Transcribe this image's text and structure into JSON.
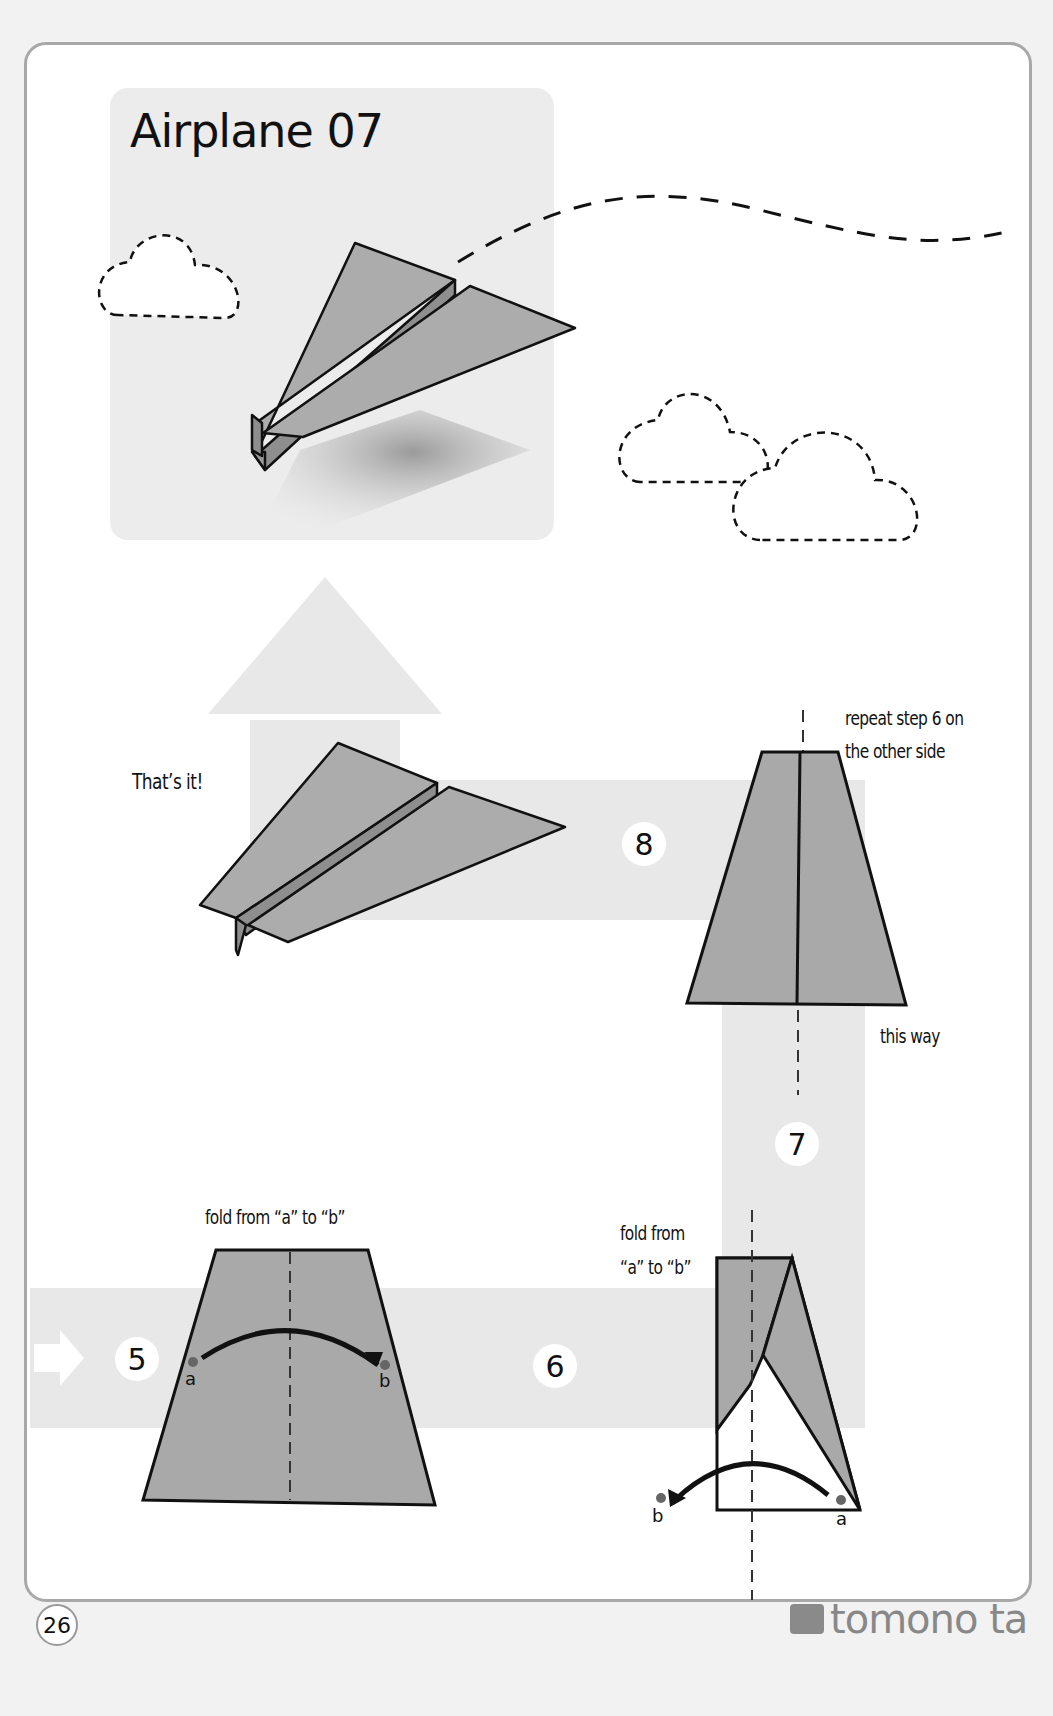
{
  "title": "Airplane 07",
  "steps": [
    {
      "number": "5",
      "instruction": "fold from “a” to “b”",
      "point_a": "a",
      "point_b": "b"
    },
    {
      "number": "6",
      "instruction_line1": "fold from",
      "instruction_line2": "“a” to “b”",
      "point_a": "a",
      "point_b": "b"
    },
    {
      "number": "7",
      "note_line1": "repeat step 6 on",
      "note_line2": "the other side",
      "direction_note": "this way"
    },
    {
      "number": "8",
      "finish_text": "That’s it!"
    }
  ],
  "footer": {
    "page_number": "26",
    "brand": "tomono ta"
  },
  "colors": {
    "paper": "#a9a9a9",
    "path_band": "#e8e8e8",
    "outline": "#111111",
    "frame": "#a8a8a8"
  }
}
